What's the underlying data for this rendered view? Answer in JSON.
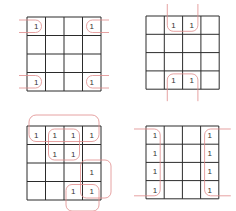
{
  "colors": {
    "grid": "#2b2b2b",
    "group": "#e08a8a",
    "text": "#333333",
    "background": "#ffffff"
  },
  "kmaps": [
    {
      "id": "corners",
      "position": {
        "x": 27,
        "y": 17
      },
      "cell_size": 18.5,
      "cells": [
        [
          "1",
          "",
          "",
          "1"
        ],
        [
          "",
          "",
          "",
          ""
        ],
        [
          "",
          "",
          "",
          ""
        ],
        [
          "1",
          "",
          "",
          "1"
        ]
      ],
      "groups": [
        {
          "type": "wrap-corners",
          "cells": [
            [
              0,
              0
            ],
            [
              0,
              3
            ],
            [
              3,
              0
            ],
            [
              3,
              3
            ]
          ]
        }
      ]
    },
    {
      "id": "top-bottom-middle",
      "position": {
        "x": 146,
        "y": 16
      },
      "cell_size": 18.3,
      "cells": [
        [
          "",
          "1",
          "1",
          ""
        ],
        [
          "",
          "",
          "",
          ""
        ],
        [
          "",
          "",
          "",
          ""
        ],
        [
          "",
          "1",
          "1",
          ""
        ]
      ],
      "groups": [
        {
          "type": "wrap-vertical",
          "cells": [
            [
              0,
              1
            ],
            [
              0,
              2
            ],
            [
              3,
              1
            ],
            [
              3,
              2
            ]
          ]
        }
      ]
    },
    {
      "id": "mixed",
      "position": {
        "x": 27,
        "y": 126
      },
      "cell_size": 18.5,
      "cells": [
        [
          "1",
          "1",
          "1",
          "1"
        ],
        [
          "",
          "1",
          "1",
          ""
        ],
        [
          "",
          "",
          "",
          "1"
        ],
        [
          "",
          "",
          "1",
          "1"
        ]
      ],
      "groups": [
        {
          "type": "row",
          "cells": [
            [
              0,
              0
            ],
            [
              0,
              1
            ],
            [
              0,
              2
            ],
            [
              0,
              3
            ]
          ]
        },
        {
          "type": "square",
          "cells": [
            [
              0,
              1
            ],
            [
              0,
              2
            ],
            [
              1,
              1
            ],
            [
              1,
              2
            ]
          ]
        },
        {
          "type": "vertical-pair",
          "cells": [
            [
              2,
              3
            ],
            [
              3,
              3
            ]
          ]
        },
        {
          "type": "horizontal-pair",
          "cells": [
            [
              3,
              2
            ],
            [
              3,
              3
            ]
          ]
        }
      ]
    },
    {
      "id": "left-right-columns",
      "position": {
        "x": 146,
        "y": 126
      },
      "cell_size": 18.2,
      "cells": [
        [
          "1",
          "",
          "",
          "1"
        ],
        [
          "1",
          "",
          "",
          "1"
        ],
        [
          "1",
          "",
          "",
          "1"
        ],
        [
          "1",
          "",
          "",
          "1"
        ]
      ],
      "groups": [
        {
          "type": "wrap-horizontal",
          "cells": [
            [
              0,
              0
            ],
            [
              1,
              0
            ],
            [
              2,
              0
            ],
            [
              3,
              0
            ],
            [
              0,
              3
            ],
            [
              1,
              3
            ],
            [
              2,
              3
            ],
            [
              3,
              3
            ]
          ]
        }
      ]
    }
  ]
}
